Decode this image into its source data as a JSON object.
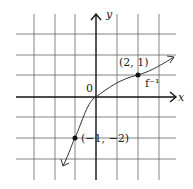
{
  "diagram": {
    "type": "function-graph",
    "curve_label": "f⁻¹",
    "axes": {
      "x_label": "x",
      "y_label": "y",
      "origin_label": "0"
    },
    "grid": {
      "x_range": [
        -3,
        3
      ],
      "y_range": [
        -3,
        3
      ],
      "spacing": 1
    },
    "points": [
      {
        "label": "(2, 1)",
        "x": 2,
        "y": 1
      },
      {
        "label": "(−1, −2)",
        "x": -1,
        "y": -2
      }
    ],
    "colors": {
      "grid": "#555555",
      "axis": "#111111",
      "curve": "#333333"
    }
  }
}
